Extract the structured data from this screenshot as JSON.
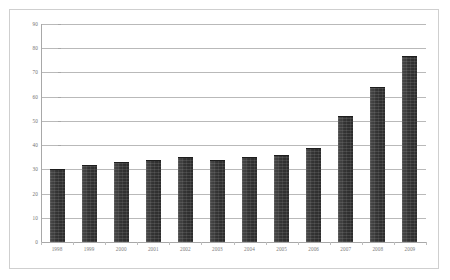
{
  "chart_data": {
    "type": "bar",
    "title": "",
    "subtitle": "",
    "xlabel": "",
    "ylabel": "",
    "categories": [
      "1998",
      "1999",
      "2000",
      "2001",
      "2002",
      "2003",
      "2004",
      "2005",
      "2006",
      "2007",
      "2008",
      "2009"
    ],
    "values": [
      30,
      32,
      33,
      34,
      35,
      34,
      35,
      36,
      39,
      52,
      64,
      77
    ],
    "series": [
      {
        "name": "",
        "values": [
          30,
          32,
          33,
          34,
          35,
          34,
          35,
          36,
          39,
          52,
          64,
          77
        ]
      }
    ],
    "ylim": [
      0,
      90
    ],
    "yticks": [
      0,
      10,
      20,
      30,
      40,
      50,
      60,
      70,
      80,
      90
    ],
    "ytick_labels": [
      "0",
      "10",
      "20",
      "30",
      "40",
      "50",
      "60",
      "70",
      "80",
      "90"
    ],
    "grid": true,
    "grid_axis": "y",
    "legend": false,
    "legend_position": "none",
    "bar_color": "#3d3d3d",
    "gridline_color": "#b9b9b9",
    "axis_color": "#a8a8a8",
    "frame_color": "#cfcfcf",
    "background_color": "#ffffff",
    "tick_label_color": "#6f6f6f",
    "annotations": []
  }
}
